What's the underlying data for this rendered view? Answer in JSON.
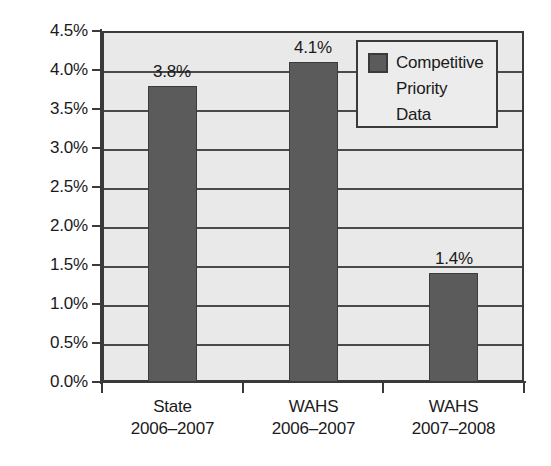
{
  "chart_data": {
    "type": "bar",
    "title": "",
    "subtitle": "",
    "xlabel": "",
    "ylabel": "",
    "categories": [
      {
        "line1": "State",
        "line2": "2006–2007"
      },
      {
        "line1": "WAHS",
        "line2": "2006–2007"
      },
      {
        "line1": "WAHS",
        "line2": "2007–2008"
      }
    ],
    "series": [
      {
        "name": "Competitive Priority Data",
        "values": [
          3.8,
          4.1,
          1.4
        ],
        "value_labels": [
          "3.8%",
          "4.1%",
          "1.4%"
        ],
        "color": "#5b5b5b"
      }
    ],
    "ylim": [
      0.0,
      4.5
    ],
    "ytick_values": [
      4.5,
      4.0,
      3.5,
      3.0,
      2.5,
      2.0,
      1.5,
      1.0,
      0.5,
      0.0
    ],
    "ytick_labels": [
      "4.5%",
      "4.0%",
      "3.5%",
      "3.0%",
      "2.5%",
      "2.0%",
      "1.5%",
      "1.0%",
      "0.5%",
      "0.0%"
    ],
    "grid": true,
    "grid_axis": "y",
    "legend_position": "top-right",
    "legend": {
      "entries": [
        {
          "label_lines": [
            "Competitive",
            "Priority",
            "Data"
          ],
          "color": "#5b5b5b"
        }
      ]
    },
    "plot_background": "#e9e9e9",
    "axis_color": "#3a3a3a"
  }
}
